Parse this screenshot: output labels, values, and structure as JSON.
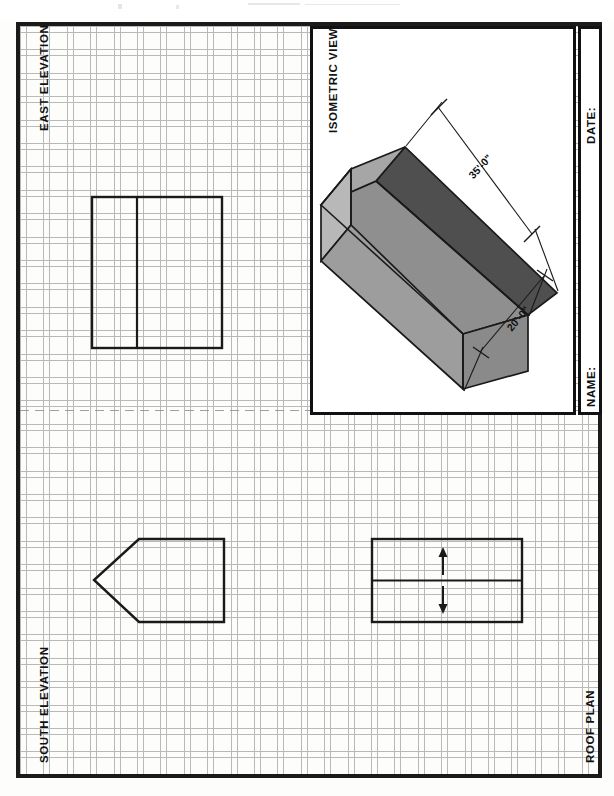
{
  "sheet": {
    "title": "Architectural Orthographic Drawing Sheet",
    "paper": "grid / graph paper",
    "frame_color": "#1a1a1a",
    "grid_color": "#b9b9b9"
  },
  "panels": {
    "east_elevation": {
      "label": "EAST ELEVATION"
    },
    "south_elevation": {
      "label": "SOUTH ELEVATION"
    },
    "roof_plan": {
      "label": "ROOF PLAN"
    },
    "isometric": {
      "label": "ISOMETRIC VIEW"
    }
  },
  "title_block": {
    "date_label": "DATE:",
    "date_value": "",
    "name_label": "NAME:",
    "name_value": ""
  },
  "isometric": {
    "dimensions": [
      {
        "name": "length",
        "text": "35'-0\"",
        "rotation_deg": -42
      },
      {
        "name": "width",
        "text": "20'-0\"",
        "rotation_deg": -62
      }
    ],
    "face_colors": {
      "roof_far": "#4a4a4a",
      "roof_near": "#8e8e8e",
      "gable_end": "#8c8c8c",
      "wall_side": "#9a9a9a",
      "wall_left": "#b5b5b5",
      "roof_left": "#a3a3a3",
      "outline": "#1a1a1a"
    }
  },
  "roof_plan_marks": {
    "up_arrow": "slope-up-arrow",
    "down_arrow": "slope-down-arrow"
  },
  "icons": {
    "arrow_up": "arrow-up-icon",
    "arrow_down": "arrow-down-icon",
    "dim_tick": "dimension-tick-icon"
  }
}
